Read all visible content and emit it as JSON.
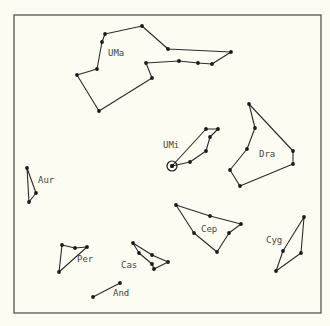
{
  "map": {
    "frame": {
      "x": 14,
      "y": 15,
      "width": 307,
      "height": 298
    },
    "colors": {
      "background": "#fdfcf3",
      "line": "#2a2a2a",
      "frame": "#555555",
      "label": "#444444"
    },
    "constellations": [
      {
        "name": "UMa",
        "label": {
          "x": 108,
          "y": 56
        },
        "closed": true,
        "points": [
          [
            142,
            26
          ],
          [
            168,
            49
          ],
          [
            231,
            52
          ],
          [
            212,
            64
          ],
          [
            198,
            63
          ],
          [
            179,
            61
          ],
          [
            146,
            63
          ],
          [
            152,
            78
          ],
          [
            99,
            111
          ],
          [
            77,
            75
          ],
          [
            97,
            69
          ],
          [
            102,
            42
          ],
          [
            105,
            34
          ]
        ]
      },
      {
        "name": "UMi",
        "label": {
          "x": 163,
          "y": 148
        },
        "closed": true,
        "points": [
          [
            172,
            166
          ],
          [
            190,
            162
          ],
          [
            206,
            151
          ],
          [
            210,
            137
          ],
          [
            218,
            129
          ],
          [
            206,
            129
          ]
        ]
      },
      {
        "name": "Dra",
        "label": {
          "x": 259,
          "y": 157
        },
        "closed": true,
        "points": [
          [
            249,
            104
          ],
          [
            255,
            128
          ],
          [
            247,
            149
          ],
          [
            230,
            170
          ],
          [
            240,
            186
          ],
          [
            293,
            164
          ],
          [
            293,
            151
          ]
        ]
      },
      {
        "name": "Aur",
        "label": {
          "x": 38,
          "y": 183
        },
        "closed": true,
        "points": [
          [
            27,
            168
          ],
          [
            36,
            193
          ],
          [
            29,
            202
          ]
        ]
      },
      {
        "name": "Cep",
        "label": {
          "x": 201,
          "y": 232
        },
        "closed": true,
        "points": [
          [
            176,
            205
          ],
          [
            210,
            216
          ],
          [
            241,
            224
          ],
          [
            229,
            233
          ],
          [
            217,
            252
          ],
          [
            194,
            233
          ]
        ]
      },
      {
        "name": "Cyg",
        "label": {
          "x": 266,
          "y": 243
        },
        "closed": true,
        "points": [
          [
            304,
            217
          ],
          [
            283,
            251
          ],
          [
            276,
            271
          ],
          [
            301,
            253
          ]
        ]
      },
      {
        "name": "Per",
        "label": {
          "x": 77,
          "y": 262
        },
        "closed": true,
        "points": [
          [
            62,
            245
          ],
          [
            75,
            248
          ],
          [
            87,
            247
          ],
          [
            59,
            272
          ]
        ]
      },
      {
        "name": "Cas",
        "label": {
          "x": 121,
          "y": 268
        },
        "closed": true,
        "points": [
          [
            133,
            243
          ],
          [
            139,
            253
          ],
          [
            152,
            264
          ],
          [
            154,
            269
          ],
          [
            168,
            262
          ],
          [
            152,
            255
          ]
        ]
      },
      {
        "name": "And",
        "label": {
          "x": 113,
          "y": 296
        },
        "closed": false,
        "points": [
          [
            93,
            297
          ],
          [
            120,
            283
          ]
        ]
      }
    ],
    "pole_marker": {
      "name": "Polaris",
      "x": 172,
      "y": 166,
      "r": 5
    }
  }
}
